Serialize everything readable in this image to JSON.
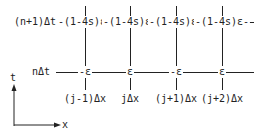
{
  "diagram": {
    "row_labels": {
      "top": "(n+1)Δt",
      "middle": "nΔt"
    },
    "top_row_nodes": [
      "-(1-4s)ε-",
      "-(1-4s)ε-",
      "-(1-4s)ε-",
      "-(1-4s)ε-"
    ],
    "middle_row_nodes": [
      "-ε",
      "ε",
      "-ε",
      "ε"
    ],
    "column_labels": [
      "(j-1)Δx",
      "jΔx",
      "(j+1)Δx",
      "(j+2)Δx"
    ],
    "axes": {
      "vertical": "t",
      "horizontal": "x"
    }
  }
}
